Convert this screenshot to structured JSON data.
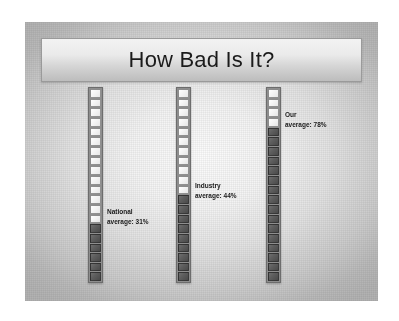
{
  "slide": {
    "title": "How Bad Is It?",
    "background_color": "#e2e2e2",
    "frame_color": "#b2b2b2"
  },
  "chart_data": {
    "type": "bar",
    "title": "How Bad Is It?",
    "orientation": "vertical",
    "style": "segmented-gauge",
    "segments_per_bar": 20,
    "categories": [
      "National average",
      "Industry average",
      "Our average"
    ],
    "values": [
      31,
      44,
      78
    ],
    "value_labels": [
      "31%",
      "44%",
      "78%"
    ],
    "ylim": [
      0,
      100
    ],
    "ylabel": "",
    "xlabel": "",
    "grid": false,
    "legend": "none",
    "unit": "%",
    "filled_color": "#5c5c5c",
    "empty_color": "#f4f4f4",
    "bars": [
      {
        "id": "bar-national",
        "name_line1": "National",
        "name_line2": "average: 31%",
        "label_text": "National average: 31%",
        "value": 31,
        "filled_segments": 6,
        "total_segments": 20
      },
      {
        "id": "bar-industry",
        "name_line1": "Industry",
        "name_line2": "average: 44%",
        "label_text": "Industry average: 44%",
        "value": 44,
        "filled_segments": 9,
        "total_segments": 20
      },
      {
        "id": "bar-our",
        "name_line1": "Our",
        "name_line2": "average: 78%",
        "label_text": "Our average: 78%",
        "value": 78,
        "filled_segments": 16,
        "total_segments": 20
      }
    ]
  }
}
